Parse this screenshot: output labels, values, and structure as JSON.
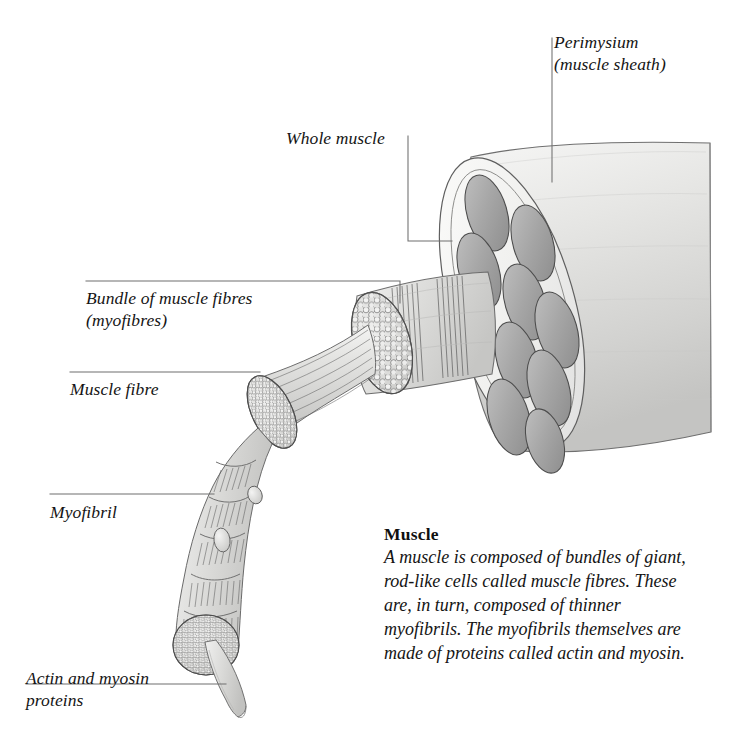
{
  "figure": {
    "background_color": "#ffffff",
    "line_color": "#6b6b6b",
    "ink_color": "#3a3a3a",
    "fascicle_fill": "#a8a8a8",
    "sheath_fill": "#f0f0ee",
    "tissue_fill": "#dcdcda"
  },
  "labels": {
    "perimysium": "Perimysium\n(muscle sheath)",
    "whole_muscle": "Whole muscle",
    "bundle": "Bundle of muscle fibres\n(myofibres)",
    "muscle_fibre": "Muscle fibre",
    "myofibril": "Myofibril",
    "actin_myosin": "Actin and myosin\nproteins"
  },
  "caption": {
    "title": "Muscle",
    "body": "A muscle is composed of bundles of giant, rod-like cells called muscle fibres. These are, in turn, composed of thinner myofibrils. The myofibrils themselves are made of proteins called actin and myosin."
  },
  "structures": {
    "whole_muscle": {
      "name": "whole-muscle-body",
      "fascicle_count": 10
    },
    "fibre_bundle": {
      "name": "muscle-fibre-bundle",
      "fibre_count": 46
    },
    "muscle_fibre": {
      "name": "single-muscle-fibre",
      "myofibril_dots": 60
    },
    "myofibril": {
      "name": "single-myofibril",
      "sarcomere_bands": 6,
      "nuclei": 2,
      "protein_dots": 150
    },
    "filament": {
      "name": "actin-myosin-filament"
    }
  }
}
